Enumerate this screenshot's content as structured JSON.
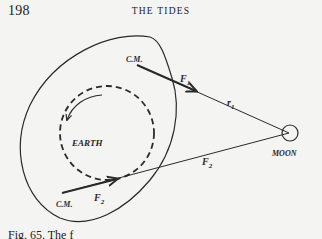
{
  "header": {
    "page_number": "198",
    "running_title": "THE TIDES"
  },
  "figure": {
    "labels": {
      "cm_top": "C.M.",
      "f1": "F",
      "f1_sub": "1",
      "r1": "r",
      "r1_sub": "1",
      "earth": "EARTH",
      "moon": "MOON",
      "f2_near": "F",
      "f2_near_sub": "2",
      "r2": "F",
      "r2_sub": "2",
      "cm_bottom": "C.M."
    },
    "colors": {
      "ink": "#2a2a2a",
      "paper": "#f4f4f2"
    }
  },
  "caption": {
    "text": "Fig. 65. The f"
  }
}
